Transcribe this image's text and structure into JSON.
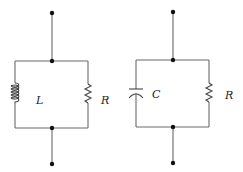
{
  "diagram": {
    "type": "circuit-schematic",
    "circuits": [
      {
        "id": "parallel-LR",
        "elements": [
          {
            "kind": "inductor",
            "label": "L"
          },
          {
            "kind": "resistor",
            "label": "R"
          }
        ],
        "connection": "parallel",
        "terminals": 2
      },
      {
        "id": "parallel-CR",
        "elements": [
          {
            "kind": "capacitor",
            "label": "C"
          },
          {
            "kind": "resistor",
            "label": "R"
          }
        ],
        "connection": "parallel",
        "terminals": 2
      }
    ]
  },
  "labels": {
    "left_L": "L",
    "left_R": "R",
    "right_C": "C",
    "right_R": "R"
  },
  "colors": {
    "wire": "#6a6a6a",
    "node": "#111111",
    "background": "#ffffff"
  }
}
